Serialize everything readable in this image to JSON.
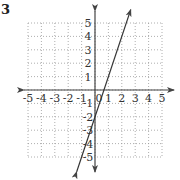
{
  "problem_number": "3",
  "graph": {
    "x_ticks": [
      "-5",
      "-4",
      "-3",
      "-2",
      "-1",
      "0",
      "1",
      "2",
      "3",
      "4",
      "5"
    ],
    "y_ticks": [
      "5",
      "4",
      "3",
      "2",
      "1",
      "-1",
      "-2",
      "-3",
      "-4",
      "-5"
    ],
    "x_range": [
      -5,
      5
    ],
    "y_range": [
      -5,
      5
    ],
    "line": {
      "slope": 3,
      "intercept": -2,
      "equation": "y = 3x - 2"
    },
    "grid": "dotted",
    "colors": {
      "axis": "#444444",
      "grid": "#999999",
      "line": "#333333",
      "text": "#333333"
    }
  }
}
